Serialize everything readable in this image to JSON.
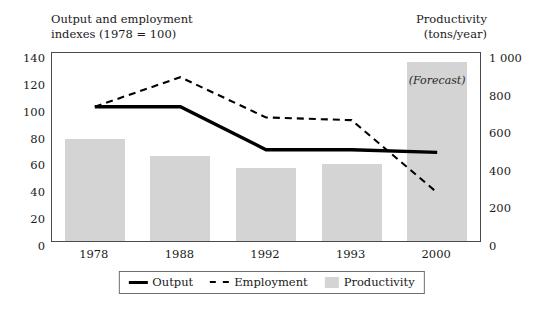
{
  "chart_data": {
    "type": "bar",
    "title": "",
    "categories": [
      "1978",
      "1988",
      "1992",
      "1993",
      "2000"
    ],
    "xlabel": "",
    "left_axis": {
      "label": "Output and employment indexes (1978 = 100)",
      "label_line1": "Output and employment",
      "label_line2": "indexes (1978 = 100)",
      "ticks": [
        "140",
        "120",
        "100",
        "80",
        "60",
        "40",
        "20",
        "0"
      ],
      "tick_values": [
        140,
        120,
        100,
        80,
        60,
        40,
        20,
        0
      ],
      "ylim": [
        0,
        140
      ]
    },
    "right_axis": {
      "label": "Productivity (tons/year)",
      "label_line1": "Productivity",
      "label_line2": "(tons/year)",
      "ticks": [
        "1 000",
        "800",
        "600",
        "400",
        "200",
        "0"
      ],
      "tick_values": [
        1000,
        800,
        600,
        400,
        200,
        0
      ],
      "ylim": [
        0,
        1000
      ]
    },
    "series": [
      {
        "name": "Output",
        "type": "line",
        "style": "solid",
        "axis": "left",
        "color": "#000000",
        "values": [
          100,
          100,
          68,
          68,
          66
        ]
      },
      {
        "name": "Employment",
        "type": "line",
        "style": "dashed",
        "axis": "left",
        "color": "#000000",
        "values": [
          100,
          122,
          92,
          90,
          36
        ]
      },
      {
        "name": "Productivity",
        "type": "bar",
        "axis": "right",
        "color": "#d4d4d4",
        "values": [
          540,
          450,
          390,
          410,
          950
        ]
      }
    ],
    "annotations": [
      {
        "text": "(Forecast)",
        "category": "2000",
        "style": "italic"
      }
    ],
    "legend": {
      "position": "bottom",
      "entries": [
        {
          "label": "Output",
          "marker": "solid-line"
        },
        {
          "label": "Employment",
          "marker": "dashed-line"
        },
        {
          "label": "Productivity",
          "marker": "filled-box"
        }
      ]
    },
    "grid": false,
    "frame": true
  }
}
